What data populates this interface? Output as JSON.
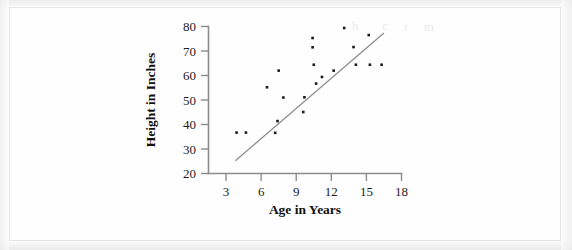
{
  "figure": {
    "background_color": "#fdfdfc",
    "border_color": "#e6e6e6"
  },
  "chart_data": {
    "type": "scatter",
    "title": "",
    "xlabel": "Age in Years",
    "ylabel": "Height in Inches",
    "xlim": [
      1.5,
      18
    ],
    "ylim": [
      20,
      80
    ],
    "xticks": [
      3,
      6,
      9,
      12,
      15,
      18
    ],
    "yticks": [
      20,
      30,
      40,
      50,
      60,
      70,
      80
    ],
    "xtick_labels": [
      "3",
      "6",
      "9",
      "12",
      "15",
      "18"
    ],
    "ytick_labels": [
      "20",
      "30",
      "40",
      "50",
      "60",
      "70",
      "80"
    ],
    "grid": false,
    "legend": false,
    "marker": "square",
    "marker_color": "#1a1a1a",
    "points": [
      {
        "x": 3.9,
        "y": 36.7
      },
      {
        "x": 4.7,
        "y": 36.7
      },
      {
        "x": 6.5,
        "y": 55.2
      },
      {
        "x": 7.2,
        "y": 36.6
      },
      {
        "x": 7.4,
        "y": 41.4
      },
      {
        "x": 7.5,
        "y": 62.0
      },
      {
        "x": 7.9,
        "y": 51.0
      },
      {
        "x": 9.6,
        "y": 45.1
      },
      {
        "x": 9.7,
        "y": 51.1
      },
      {
        "x": 10.4,
        "y": 75.3
      },
      {
        "x": 10.4,
        "y": 71.5
      },
      {
        "x": 10.5,
        "y": 64.4
      },
      {
        "x": 10.7,
        "y": 56.7
      },
      {
        "x": 11.2,
        "y": 59.4
      },
      {
        "x": 12.2,
        "y": 62.0
      },
      {
        "x": 13.1,
        "y": 79.4
      },
      {
        "x": 13.9,
        "y": 71.6
      },
      {
        "x": 14.1,
        "y": 64.4
      },
      {
        "x": 15.2,
        "y": 76.5
      },
      {
        "x": 15.3,
        "y": 64.4
      },
      {
        "x": 16.3,
        "y": 64.4
      }
    ],
    "trendline": {
      "label": "",
      "x_start": 3.8,
      "y_start": 25.2,
      "x_end": 16.5,
      "y_end": 77.3,
      "color": "#8e8e8e"
    }
  }
}
